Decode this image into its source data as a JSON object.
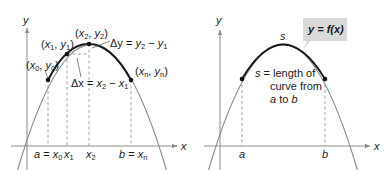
{
  "colors": {
    "thick_curve": "#1a1a1a",
    "thin_curve": "#8c8c8c",
    "axis": "#8c8c8c",
    "dash": "#8c8c8c",
    "point": "#111111",
    "callout_bg": "#d9d9d9",
    "text": "#1a1a1a"
  },
  "left_panel": {
    "axis_labels": {
      "x": "x",
      "y": "y"
    },
    "points": [
      {
        "label_x": "x",
        "label_x_sub": "0",
        "label_y": "y",
        "label_y_sub": "0"
      },
      {
        "label_x": "x",
        "label_x_sub": "1",
        "label_y": "y",
        "label_y_sub": "1"
      },
      {
        "label_x": "x",
        "label_x_sub": "2",
        "label_y": "y",
        "label_y_sub": "2"
      },
      {
        "label_x": "x",
        "label_x_sub": "n",
        "label_y": "y",
        "label_y_sub": "n"
      }
    ],
    "delta_y": {
      "lhs": "Δy",
      "eq": " = ",
      "a": "y",
      "a_sub": "2",
      "minus": " − ",
      "b": "y",
      "b_sub": "1"
    },
    "delta_x": {
      "lhs": "Δx",
      "eq": " = ",
      "a": "x",
      "a_sub": "2",
      "minus": " − ",
      "b": "x",
      "b_sub": "1"
    },
    "x_ticks": [
      {
        "pre": "a",
        "eq": " = ",
        "var": "x",
        "sub": "0"
      },
      {
        "pre": "",
        "eq": "",
        "var": "x",
        "sub": "1"
      },
      {
        "pre": "",
        "eq": "",
        "var": "x",
        "sub": "2"
      },
      {
        "pre": "b",
        "eq": " = ",
        "var": "x",
        "sub": "n"
      }
    ]
  },
  "right_panel": {
    "axis_labels": {
      "x": "x",
      "y": "y"
    },
    "arc_label": "s",
    "callout": {
      "text": "y = f(x)"
    },
    "description": [
      "s = length of",
      "curve from",
      "a to b"
    ],
    "desc_parts": {
      "line1_var": "s",
      "line1_rest": " = length of",
      "line2": "curve from",
      "line3_a": "a",
      "line3_mid": " to ",
      "line3_b": "b"
    },
    "x_ticks": [
      "a",
      "b"
    ]
  }
}
